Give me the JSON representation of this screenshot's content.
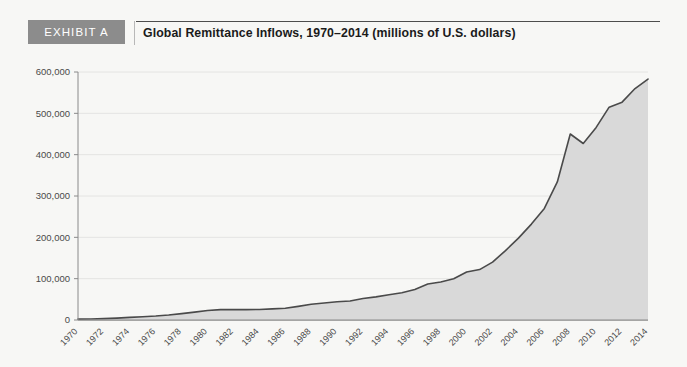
{
  "exhibit": {
    "badge_label": "EXHIBIT A",
    "title": "Global Remittance Inflows, 1970–2014 (millions of U.S. dollars)"
  },
  "colors": {
    "background": "#f7f7f5",
    "badge_bg": "#8c8c8c",
    "badge_text": "#ffffff",
    "title_text": "#1b1b1b",
    "rule": "#4d4d4d",
    "area_fill": "#d9d9d9",
    "line": "#4a4a4a",
    "gridline": "#e4e4e2",
    "axis": "#8a8a8a",
    "tick_text": "#4a4a4a"
  },
  "chart_data": {
    "type": "area",
    "title": "Global Remittance Inflows, 1970–2014 (millions of U.S. dollars)",
    "xlabel": "",
    "ylabel": "",
    "ylim": [
      0,
      600000
    ],
    "xlim": [
      1970,
      2014
    ],
    "grid": true,
    "legend": null,
    "ytick_labels": [
      "0",
      "100,000",
      "200,000",
      "300,000",
      "400,000",
      "500,000",
      "600,000"
    ],
    "ytick_values": [
      0,
      100000,
      200000,
      300000,
      400000,
      500000,
      600000
    ],
    "xtick_labels": [
      "1970",
      "1972",
      "1974",
      "1976",
      "1978",
      "1980",
      "1982",
      "1984",
      "1986",
      "1988",
      "1990",
      "1992",
      "1994",
      "1996",
      "1998",
      "2000",
      "2002",
      "2004",
      "2006",
      "2008",
      "2010",
      "2012",
      "2014"
    ],
    "xtick_values": [
      1970,
      1972,
      1974,
      1976,
      1978,
      1980,
      1982,
      1984,
      1986,
      1988,
      1990,
      1992,
      1994,
      1996,
      1998,
      2000,
      2002,
      2004,
      2006,
      2008,
      2010,
      2012,
      2014
    ],
    "x": [
      1970,
      1971,
      1972,
      1973,
      1974,
      1975,
      1976,
      1977,
      1978,
      1979,
      1980,
      1981,
      1982,
      1983,
      1984,
      1985,
      1986,
      1987,
      1988,
      1989,
      1990,
      1991,
      1992,
      1993,
      1994,
      1995,
      1996,
      1997,
      1998,
      1999,
      2000,
      2001,
      2002,
      2003,
      2004,
      2005,
      2006,
      2007,
      2008,
      2009,
      2010,
      2011,
      2012,
      2013,
      2014
    ],
    "values": [
      2000,
      2600,
      3400,
      4600,
      6300,
      8000,
      9500,
      12000,
      15500,
      19000,
      23000,
      25000,
      25500,
      25000,
      25500,
      27000,
      28500,
      33000,
      38000,
      41000,
      44000,
      46000,
      52000,
      56000,
      61000,
      66000,
      74000,
      87000,
      92000,
      100000,
      116000,
      122000,
      140000,
      168000,
      198000,
      232000,
      270000,
      334000,
      450000,
      427000,
      466000,
      515000,
      527000,
      560000,
      583000
    ],
    "series_name": "Global remittance inflows"
  }
}
